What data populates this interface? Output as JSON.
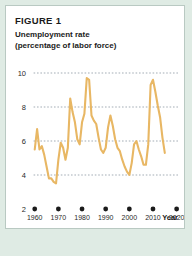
{
  "figure": {
    "label": "FIGURE 1",
    "title_line1": "Unemployment rate",
    "title_line2": "(percentage of labor force)"
  },
  "colors": {
    "line": "#e8b764",
    "page_background": "#dfebe4",
    "card_background": "#ffffff",
    "card_border": "#b9c9c2",
    "gridline": "#7d8a96",
    "text": "#1b1b1b"
  },
  "chart_data": {
    "type": "line",
    "title": "Unemployment rate (percentage of labor force)",
    "xlabel": "Year",
    "ylabel": "",
    "xlim": [
      1958,
      2021
    ],
    "ylim": [
      2,
      10
    ],
    "grid": true,
    "legend": false,
    "y_ticks": [
      10,
      8,
      6,
      4,
      2
    ],
    "y_tick_labels": [
      "10",
      "8",
      "6",
      "4",
      "2"
    ],
    "x_ticks": [
      1960,
      1970,
      1980,
      1990,
      2000,
      2010,
      2020
    ],
    "x_tick_labels": [
      "1960",
      "1970",
      "1980",
      "1990",
      "2000",
      "2010",
      "2020"
    ],
    "series": [
      {
        "name": "Unemployment rate",
        "color": "#e8b764",
        "x": [
          1960,
          1961,
          1962,
          1963,
          1964,
          1965,
          1966,
          1967,
          1968,
          1969,
          1970,
          1971,
          1972,
          1973,
          1974,
          1975,
          1976,
          1977,
          1978,
          1979,
          1980,
          1981,
          1982,
          1983,
          1984,
          1985,
          1986,
          1987,
          1988,
          1989,
          1990,
          1991,
          1992,
          1993,
          1994,
          1995,
          1996,
          1997,
          1998,
          1999,
          2000,
          2001,
          2002,
          2003,
          2004,
          2005,
          2006,
          2007,
          2008,
          2009,
          2010,
          2011,
          2012,
          2013,
          2014,
          2015
        ],
        "values": [
          5.5,
          6.7,
          5.5,
          5.7,
          5.2,
          4.5,
          3.8,
          3.8,
          3.6,
          3.5,
          4.9,
          5.9,
          5.6,
          4.9,
          5.6,
          8.5,
          7.7,
          7.1,
          6.1,
          5.8,
          7.1,
          7.6,
          9.7,
          9.6,
          7.5,
          7.2,
          7.0,
          6.2,
          5.5,
          5.3,
          5.6,
          6.8,
          7.5,
          6.9,
          6.1,
          5.6,
          5.4,
          4.9,
          4.5,
          4.2,
          4.0,
          4.7,
          5.8,
          6.0,
          5.5,
          5.1,
          4.6,
          4.6,
          5.8,
          9.3,
          9.6,
          8.9,
          8.1,
          7.4,
          6.2,
          5.3
        ]
      }
    ]
  }
}
